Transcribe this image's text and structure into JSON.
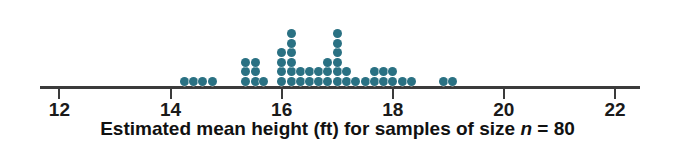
{
  "figure": {
    "type": "dotplot",
    "caption_prefix": "Estimated mean height (ft) for samples of size ",
    "caption_var": "n",
    "caption_suffix": " = 80",
    "caption_full": "Estimated mean height (ft) for samples of size n = 80",
    "dot_color": "#2a7183",
    "axis_color": "#3b3b3b",
    "text_color": "#111111"
  },
  "axis": {
    "label": "Estimated mean height (ft) for samples of size n = 80",
    "min": 11.65,
    "max": 22.45,
    "ticks": [
      12,
      14,
      16,
      18,
      20,
      22
    ],
    "tick_labels": [
      "12",
      "14",
      "16",
      "18",
      "20",
      "22"
    ]
  },
  "chart_data": {
    "type": "dotplot",
    "title": "",
    "xlabel": "Estimated mean height (ft) for samples of size n = 80",
    "ylabel": "",
    "xlim": [
      11.65,
      22.45
    ],
    "bin_width": 0.1667,
    "grid": false,
    "legend": "none",
    "dot_value": 1,
    "total_dots": 60,
    "x": [
      14.25,
      14.42,
      14.58,
      14.75,
      15.35,
      15.52,
      15.68,
      16.0,
      16.17,
      16.33,
      16.5,
      16.67,
      16.83,
      17.0,
      17.17,
      17.33,
      17.5,
      17.67,
      17.83,
      18.0,
      18.17,
      18.33,
      18.92,
      19.08
    ],
    "counts": [
      1,
      1,
      1,
      1,
      3,
      3,
      1,
      4,
      6,
      2,
      2,
      2,
      3,
      6,
      2,
      1,
      1,
      2,
      2,
      2,
      1,
      1,
      1,
      1
    ],
    "columns": [
      {
        "value": 14.25,
        "count": 1
      },
      {
        "value": 14.42,
        "count": 1
      },
      {
        "value": 14.58,
        "count": 1
      },
      {
        "value": 14.75,
        "count": 1
      },
      {
        "value": 15.35,
        "count": 3
      },
      {
        "value": 15.52,
        "count": 3
      },
      {
        "value": 15.68,
        "count": 1
      },
      {
        "value": 16.0,
        "count": 4
      },
      {
        "value": 16.17,
        "count": 6
      },
      {
        "value": 16.33,
        "count": 2
      },
      {
        "value": 16.5,
        "count": 2
      },
      {
        "value": 16.67,
        "count": 2
      },
      {
        "value": 16.83,
        "count": 3
      },
      {
        "value": 17.0,
        "count": 6
      },
      {
        "value": 17.17,
        "count": 2
      },
      {
        "value": 17.33,
        "count": 1
      },
      {
        "value": 17.5,
        "count": 1
      },
      {
        "value": 17.67,
        "count": 2
      },
      {
        "value": 17.83,
        "count": 2
      },
      {
        "value": 18.0,
        "count": 2
      },
      {
        "value": 18.17,
        "count": 1
      },
      {
        "value": 18.33,
        "count": 1
      },
      {
        "value": 18.92,
        "count": 1
      },
      {
        "value": 19.08,
        "count": 1
      }
    ]
  }
}
